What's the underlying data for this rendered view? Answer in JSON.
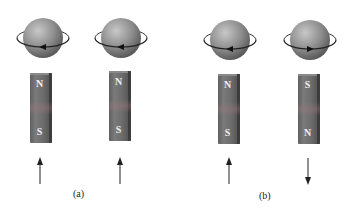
{
  "panels": [
    {
      "label": "(a)",
      "items": [
        {
          "spin_direction": "left",
          "magnet_top": "N",
          "magnet_bottom": "S",
          "moment_arrow": "up"
        },
        {
          "spin_direction": "left",
          "magnet_top": "N",
          "magnet_bottom": "S",
          "moment_arrow": "up"
        }
      ]
    },
    {
      "label": "(b)",
      "items": [
        {
          "spin_direction": "left",
          "magnet_top": "N",
          "magnet_bottom": "S",
          "moment_arrow": "up"
        },
        {
          "spin_direction": "right",
          "magnet_top": "S",
          "magnet_bottom": "N",
          "moment_arrow": "down"
        }
      ]
    }
  ],
  "icons": {
    "sphere": "spinning-electron-sphere-icon",
    "magnet": "bar-magnet-icon",
    "arrow_up": "arrow-up-icon",
    "arrow_down": "arrow-down-icon"
  },
  "colors": {
    "sphere_light": "#b8b8b8",
    "sphere_dark": "#5a5a5a",
    "magnet": "#676767",
    "ring": "#222222"
  }
}
